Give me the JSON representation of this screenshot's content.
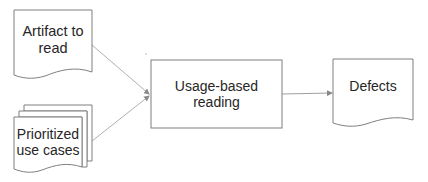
{
  "diagram": {
    "nodes": {
      "artifact": {
        "lines": [
          "Artifact to",
          "read"
        ],
        "shape": "document"
      },
      "use_cases": {
        "lines": [
          "Prioritized",
          "use cases"
        ],
        "shape": "multi-document"
      },
      "process": {
        "label": "Usage-based reading",
        "shape": "process"
      },
      "defects": {
        "label": "Defects",
        "shape": "document"
      }
    },
    "edges": [
      {
        "from": "artifact",
        "to": "process"
      },
      {
        "from": "use_cases",
        "to": "process"
      },
      {
        "from": "process",
        "to": "defects"
      }
    ],
    "colors": {
      "stroke": "#7f7f7f",
      "arrow": "#a6a6a6",
      "text": "#262626",
      "fill": "#ffffff"
    }
  }
}
